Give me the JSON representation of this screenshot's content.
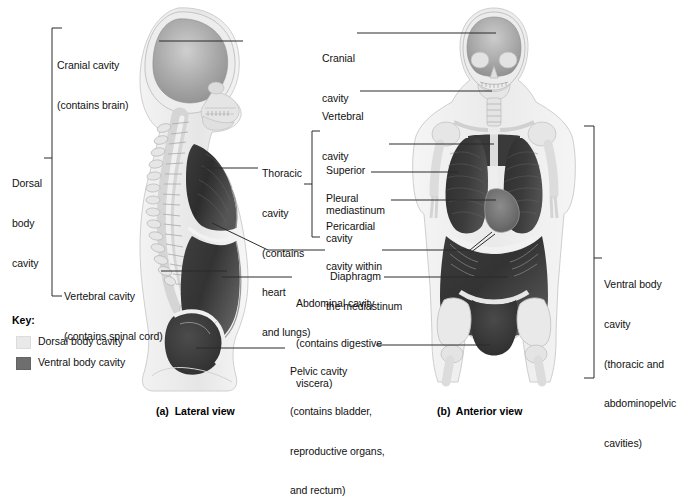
{
  "figure": {
    "captions": {
      "a": "(a)  Lateral view",
      "b": "(b)  Anterior view"
    }
  },
  "brackets": {
    "dorsal": {
      "label_line1": "Dorsal",
      "label_line2": "body",
      "label_line3": "cavity"
    },
    "thoracic_sub": {
      "present": true
    },
    "ventral": {
      "label_line1": "Ventral body",
      "label_line2": "cavity",
      "label_line3": "(thoracic and",
      "label_line4": "abdominopelvic",
      "label_line5": "cavities)"
    }
  },
  "labels_lateral": {
    "cranial": {
      "line1": "Cranial cavity",
      "line2": "(contains brain)"
    },
    "thoracic": {
      "line1": "Thoracic",
      "line2": "cavity",
      "line3": "(contains",
      "line4": "heart",
      "line5": "and lungs)"
    },
    "vertebral": {
      "line1": "Vertebral cavity",
      "line2": "(contains spinal cord)"
    },
    "diaphragm": {
      "line1": "Diaphragm"
    },
    "abdominal": {
      "line1": "Abdominal cavity",
      "line2": "(contains digestive",
      "line3": "viscera)"
    },
    "pelvic": {
      "line1": "Pelvic cavity",
      "line2": "(contains bladder,",
      "line3": "reproductive organs,",
      "line4": "and rectum)"
    }
  },
  "labels_anterior": {
    "cranial": {
      "line1": "Cranial",
      "line2": "cavity"
    },
    "vertebral": {
      "line1": "Vertebral",
      "line2": "cavity"
    },
    "superior_mediastinum": {
      "line1": "Superior",
      "line2": "mediastinum"
    },
    "pleural": {
      "line1": "Pleural",
      "line2": "cavity"
    },
    "pericardial": {
      "line1": "Pericardial",
      "line2": "cavity within",
      "line3": "the mediastinum"
    }
  },
  "key": {
    "title": "Key:",
    "items": [
      {
        "label": "Dorsal body cavity",
        "color": "#e9e9e9",
        "name": "dorsal-body-cavity"
      },
      {
        "label": "Ventral body cavity",
        "color": "#6e6e6e",
        "name": "ventral-body-cavity"
      }
    ]
  },
  "colors": {
    "dorsal_cavity": "#e9e9e9",
    "ventral_cavity": "#4a4a4a",
    "body_outline": "#c9c9c9",
    "bone": "#dedede",
    "leader_line": "#2b2b2b",
    "text": "#111111",
    "background": "#ffffff"
  }
}
